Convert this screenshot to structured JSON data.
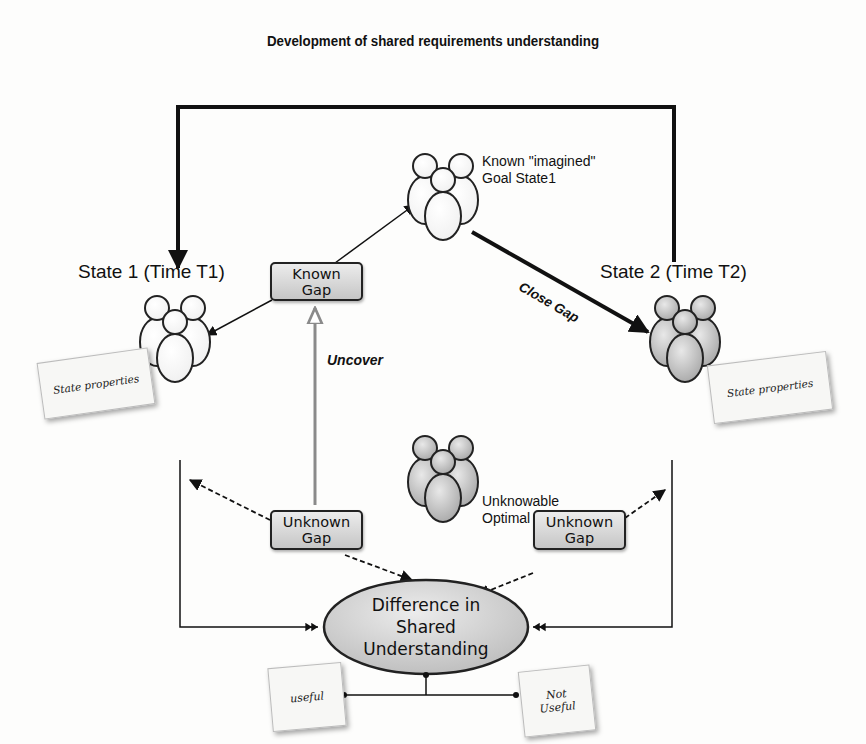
{
  "diagram": {
    "title": "Development of shared requirements understanding",
    "state1": {
      "title": "State 1 (Time T1)",
      "note": "State properties"
    },
    "state2": {
      "title": "State 2 (Time T2)",
      "note": "State properties"
    },
    "goal_state": {
      "line1": "Known \"imagined\"",
      "line2": "Goal State1"
    },
    "optimal_state": {
      "line1": "Unknowable",
      "line2": "Optimal State1"
    },
    "known_gap": {
      "line1": "Known",
      "line2": "Gap"
    },
    "unknown_gap_left": {
      "line1": "Unknown",
      "line2": "Gap"
    },
    "unknown_gap_right": {
      "line1": "Unknown",
      "line2": "Gap"
    },
    "edge_labels": {
      "uncover": "Uncover",
      "close_gap": "Close Gap"
    },
    "difference": {
      "line1": "Difference in",
      "line2": "Shared",
      "line3": "Understanding"
    },
    "outcomes": {
      "useful": "useful",
      "not_useful_line1": "Not",
      "not_useful_line2": "Useful"
    },
    "colors": {
      "line": "#111111",
      "box_top": "#ececec",
      "box_bottom": "#c6c6c6",
      "uncover_arrow": "#8a8a8a",
      "background": "#fdfdfc"
    }
  }
}
